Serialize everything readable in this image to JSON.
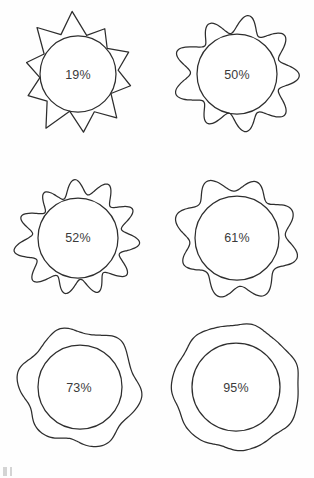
{
  "figure": {
    "background_color": "#fefefe",
    "stroke_color": "#2e2e2e",
    "label_color": "#3b3b3b",
    "columns": 2,
    "rows": 3,
    "corner_artifact": ""
  },
  "chart_data": {
    "type": "table",
    "xlabel": "",
    "ylabel": "",
    "categories": [
      "19%",
      "50%",
      "52%",
      "61%",
      "73%",
      "95%"
    ],
    "values": [
      19,
      50,
      52,
      61,
      73,
      95
    ],
    "series": [
      {
        "name": "circularity",
        "values": [
          19,
          50,
          52,
          61,
          73,
          95
        ]
      },
      {
        "name": "outer_lobe_count",
        "values": [
          10,
          9,
          11,
          8,
          6,
          7
        ]
      },
      {
        "name": "outer_lobe_amplitude",
        "values": [
          0.3,
          0.17,
          0.16,
          0.13,
          0.07,
          0.025
        ]
      }
    ],
    "legend": [],
    "grid": false
  },
  "shapes": [
    {
      "id": "shape-19",
      "label": "19%",
      "value": 19,
      "row": 1,
      "column": 1,
      "lobes": 10,
      "amplitude": 0.3,
      "spiky": true,
      "center_x": 78,
      "center_y": 74,
      "inner_radius": 38,
      "outer_base_radius": 42,
      "label_x": 78,
      "label_y": 75
    },
    {
      "id": "shape-50",
      "label": "50%",
      "value": 50,
      "row": 1,
      "column": 2,
      "lobes": 9,
      "amplitude": 0.17,
      "spiky": false,
      "center_x": 80,
      "center_y": 74,
      "inner_radius": 40,
      "outer_base_radius": 52,
      "label_x": 80,
      "label_y": 75
    },
    {
      "id": "shape-52",
      "label": "52%",
      "value": 52,
      "row": 2,
      "column": 1,
      "lobes": 11,
      "amplitude": 0.16,
      "spiky": false,
      "center_x": 78,
      "center_y": 78,
      "inner_radius": 40,
      "outer_base_radius": 52,
      "label_x": 78,
      "label_y": 78
    },
    {
      "id": "shape-61",
      "label": "61%",
      "value": 61,
      "row": 2,
      "column": 2,
      "lobes": 8,
      "amplitude": 0.13,
      "spiky": false,
      "center_x": 80,
      "center_y": 78,
      "inner_radius": 42,
      "outer_base_radius": 55,
      "label_x": 80,
      "label_y": 78
    },
    {
      "id": "shape-73",
      "label": "73%",
      "value": 73,
      "row": 3,
      "column": 1,
      "lobes": 6,
      "amplitude": 0.07,
      "spiky": false,
      "center_x": 80,
      "center_y": 72,
      "inner_radius": 42,
      "outer_base_radius": 58,
      "label_x": 79,
      "label_y": 73
    },
    {
      "id": "shape-95",
      "label": "95%",
      "value": 95,
      "row": 3,
      "column": 2,
      "lobes": 7,
      "amplitude": 0.025,
      "spiky": false,
      "center_x": 79,
      "center_y": 72,
      "inner_radius": 44,
      "outer_base_radius": 63,
      "label_x": 79,
      "label_y": 73
    }
  ]
}
